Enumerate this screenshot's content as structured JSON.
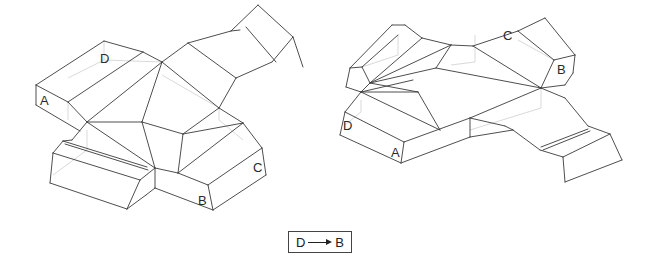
{
  "figures": [
    {
      "name": "left-net",
      "labels": [
        {
          "text": "D",
          "x": 100,
          "y": 63
        },
        {
          "text": "A",
          "x": 40,
          "y": 105
        },
        {
          "text": "C",
          "x": 253,
          "y": 172
        },
        {
          "text": "B",
          "x": 198,
          "y": 205
        }
      ],
      "edges": [
        [
          36,
          85,
          104,
          41
        ],
        [
          104,
          41,
          143,
          52
        ],
        [
          36,
          85,
          36,
          105
        ],
        [
          36,
          105,
          80,
          131
        ],
        [
          36,
          85,
          68,
          102
        ],
        [
          68,
          102,
          87,
          122
        ],
        [
          68,
          102,
          143,
          52
        ],
        [
          87,
          122,
          162,
          62
        ],
        [
          162,
          62,
          143,
          52
        ],
        [
          162,
          62,
          188,
          43
        ],
        [
          188,
          43,
          231,
          31
        ],
        [
          231,
          31,
          258,
          5
        ],
        [
          258,
          5,
          293,
          37
        ],
        [
          293,
          37,
          303,
          67
        ],
        [
          293,
          37,
          272,
          62
        ],
        [
          231,
          31,
          240,
          30
        ],
        [
          246,
          27,
          276,
          62
        ],
        [
          272,
          62,
          236,
          78
        ],
        [
          188,
          43,
          236,
          78
        ],
        [
          236,
          78,
          219,
          108
        ],
        [
          162,
          62,
          219,
          108
        ],
        [
          162,
          62,
          142,
          122
        ],
        [
          87,
          122,
          142,
          122
        ],
        [
          87,
          122,
          155,
          168
        ],
        [
          142,
          122,
          155,
          168
        ],
        [
          142,
          122,
          183,
          134
        ],
        [
          183,
          134,
          243,
          123
        ],
        [
          219,
          108,
          243,
          123
        ],
        [
          219,
          108,
          183,
          134
        ],
        [
          183,
          134,
          178,
          173
        ],
        [
          178,
          173,
          155,
          168
        ],
        [
          243,
          123,
          178,
          173
        ],
        [
          243,
          123,
          262,
          148
        ],
        [
          262,
          148,
          266,
          175
        ],
        [
          266,
          175,
          213,
          210
        ],
        [
          262,
          148,
          208,
          185
        ],
        [
          208,
          185,
          213,
          210
        ],
        [
          178,
          173,
          208,
          185
        ],
        [
          155,
          168,
          155,
          188
        ],
        [
          155,
          188,
          213,
          210
        ],
        [
          87,
          122,
          72,
          140
        ],
        [
          72,
          140,
          63,
          141
        ],
        [
          63,
          141,
          53,
          153
        ],
        [
          53,
          153,
          50,
          183
        ],
        [
          50,
          183,
          127,
          209
        ],
        [
          127,
          209,
          146,
          195
        ],
        [
          146,
          195,
          155,
          188
        ],
        [
          53,
          153,
          140,
          180
        ],
        [
          140,
          180,
          127,
          209
        ],
        [
          140,
          180,
          155,
          168
        ],
        [
          63,
          141,
          147,
          167
        ],
        [
          65,
          144,
          148,
          170
        ]
      ],
      "hidden": [
        [
          68,
          102,
          68,
          120
        ],
        [
          104,
          41,
          104,
          60
        ],
        [
          104,
          60,
          162,
          62
        ],
        [
          104,
          60,
          68,
          78
        ],
        [
          162,
          75,
          219,
          108
        ],
        [
          219,
          108,
          219,
          120
        ],
        [
          219,
          120,
          243,
          140
        ],
        [
          87,
          130,
          87,
          150
        ],
        [
          87,
          150,
          53,
          175
        ]
      ]
    },
    {
      "name": "right-net",
      "labels": [
        {
          "text": "C",
          "x": 503,
          "y": 40
        },
        {
          "text": "B",
          "x": 557,
          "y": 74
        },
        {
          "text": "D",
          "x": 343,
          "y": 130
        },
        {
          "text": "A",
          "x": 391,
          "y": 157
        }
      ],
      "edges": [
        [
          350,
          68,
          392,
          25
        ],
        [
          392,
          25,
          405,
          25
        ],
        [
          405,
          25,
          422,
          38
        ],
        [
          422,
          38,
          451,
          45
        ],
        [
          451,
          45,
          473,
          46
        ],
        [
          473,
          46,
          518,
          31
        ],
        [
          518,
          31,
          545,
          18
        ],
        [
          545,
          18,
          575,
          55
        ],
        [
          575,
          55,
          573,
          73
        ],
        [
          573,
          73,
          565,
          85
        ],
        [
          350,
          68,
          346,
          87
        ],
        [
          346,
          87,
          361,
          92
        ],
        [
          350,
          68,
          362,
          67
        ],
        [
          362,
          67,
          398,
          35
        ],
        [
          362,
          67,
          370,
          83
        ],
        [
          370,
          83,
          361,
          92
        ],
        [
          370,
          83,
          422,
          38
        ],
        [
          370,
          83,
          451,
          45
        ],
        [
          370,
          83,
          436,
          68
        ],
        [
          370,
          83,
          418,
          92
        ],
        [
          361,
          92,
          418,
          92
        ],
        [
          361,
          92,
          413,
          80
        ],
        [
          436,
          68,
          451,
          45
        ],
        [
          436,
          68,
          541,
          88
        ],
        [
          473,
          46,
          541,
          88
        ],
        [
          518,
          31,
          554,
          60
        ],
        [
          554,
          60,
          541,
          88
        ],
        [
          554,
          60,
          575,
          55
        ],
        [
          541,
          88,
          565,
          85
        ],
        [
          418,
          92,
          440,
          130
        ],
        [
          361,
          92,
          440,
          130
        ],
        [
          361,
          92,
          345,
          112
        ],
        [
          345,
          112,
          340,
          135
        ],
        [
          340,
          135,
          401,
          163
        ],
        [
          345,
          112,
          404,
          142
        ],
        [
          404,
          142,
          401,
          163
        ],
        [
          404,
          142,
          470,
          118
        ],
        [
          401,
          163,
          470,
          137
        ],
        [
          470,
          118,
          470,
          137
        ],
        [
          470,
          118,
          541,
          88
        ],
        [
          470,
          118,
          505,
          126
        ],
        [
          505,
          126,
          513,
          130
        ],
        [
          541,
          88,
          565,
          98
        ],
        [
          565,
          98,
          588,
          126
        ],
        [
          588,
          126,
          610,
          134
        ],
        [
          513,
          130,
          540,
          150
        ],
        [
          540,
          150,
          563,
          157
        ],
        [
          563,
          157,
          610,
          134
        ],
        [
          610,
          134,
          622,
          160
        ],
        [
          622,
          160,
          565,
          182
        ],
        [
          565,
          182,
          563,
          157
        ],
        [
          541,
          147,
          588,
          129
        ],
        [
          543,
          150,
          590,
          131
        ],
        [
          470,
          137,
          513,
          130
        ]
      ],
      "hidden": [
        [
          398,
          35,
          398,
          55
        ],
        [
          398,
          55,
          362,
          67
        ],
        [
          475,
          35,
          475,
          62
        ],
        [
          475,
          62,
          451,
          65
        ],
        [
          518,
          40,
          554,
          60
        ],
        [
          541,
          88,
          541,
          108
        ],
        [
          541,
          108,
          470,
          130
        ],
        [
          361,
          100,
          361,
          112
        ],
        [
          361,
          112,
          345,
          125
        ]
      ]
    }
  ],
  "caption": {
    "from": "D",
    "to": "B",
    "arrow": "right-arrow-icon"
  }
}
